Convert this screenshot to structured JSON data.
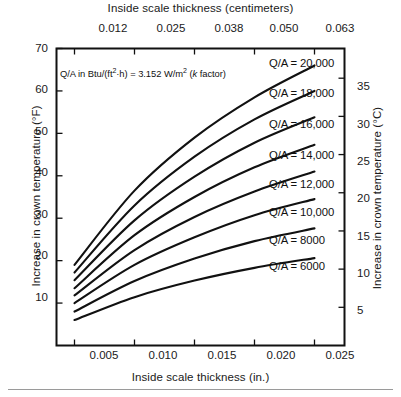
{
  "figure": {
    "background_color": "#ffffff",
    "line_color": "#111111",
    "frame_color": "#111111"
  },
  "axes": {
    "top": {
      "title": "Inside scale thickness (centimeters)",
      "ticks": [
        "0.012",
        "0.025",
        "0.038",
        "0.050",
        "0.063"
      ]
    },
    "bottom": {
      "title": "Inside scale thickness (in.)",
      "ticks": [
        "0.005",
        "0.010",
        "0.015",
        "0.020",
        "0.025"
      ]
    },
    "left": {
      "title": "Increase in crown temperature (°F)",
      "ticks": [
        "10",
        "20",
        "30",
        "40",
        "50",
        "60",
        "70"
      ]
    },
    "right": {
      "title": "Increase in crown temperature (°C)",
      "ticks": [
        "5",
        "10",
        "15",
        "20",
        "25",
        "30",
        "35"
      ]
    }
  },
  "annotation": {
    "prefix": "Q/A in Btu/(ft",
    "sup1": "2",
    "mid": "·h) = 3.152 W/m",
    "sup2": "2",
    "paren_open": " (",
    "italic_k": "k",
    "paren_close": " factor)"
  },
  "curve_labels": [
    "Q/A = 20,000",
    "Q/A = 18,000",
    "Q/A = 16,000",
    "Q/A = 14,000",
    "Q/A = 12,000",
    "Q/A = 10,000",
    "Q/A = 8000",
    "Q/A = 6000"
  ],
  "chart_data": {
    "type": "line",
    "title": "",
    "xlabel": "Inside scale thickness (in.)",
    "ylabel": "Increase in crown temperature (°F)",
    "xlabel_secondary": "Inside scale thickness (centimeters)",
    "ylabel_secondary": "Increase in crown temperature (°C)",
    "xlim": [
      0.0035,
      0.0275
    ],
    "ylim": [
      0,
      70
    ],
    "ylim_secondary": [
      0,
      38.9
    ],
    "xticks": [
      0.005,
      0.01,
      0.015,
      0.02,
      0.025
    ],
    "xticks_secondary": [
      0.012,
      0.025,
      0.038,
      0.05,
      0.063
    ],
    "yticks": [
      10,
      20,
      30,
      40,
      50,
      60,
      70
    ],
    "yticks_secondary": [
      5,
      10,
      15,
      20,
      25,
      30,
      35
    ],
    "grid": false,
    "legend": "inline-right-of-each-curve",
    "x": [
      0.005,
      0.01,
      0.015,
      0.02,
      0.025
    ],
    "series": [
      {
        "name": "Q/A = 20,000",
        "values": [
          19.0,
          36.5,
          49.0,
          58.5,
          66.0
        ]
      },
      {
        "name": "Q/A = 18,000",
        "values": [
          17.2,
          33.0,
          44.5,
          53.3,
          60.0
        ]
      },
      {
        "name": "Q/A = 16,000",
        "values": [
          15.4,
          29.5,
          39.8,
          47.8,
          53.8
        ]
      },
      {
        "name": "Q/A = 14,000",
        "values": [
          13.5,
          26.0,
          35.0,
          42.0,
          47.3
        ]
      },
      {
        "name": "Q/A = 12,000",
        "values": [
          11.8,
          22.5,
          30.3,
          36.3,
          41.0
        ]
      },
      {
        "name": "Q/A = 10,000",
        "values": [
          10.0,
          19.0,
          25.5,
          30.7,
          34.5
        ]
      },
      {
        "name": "Q/A = 8000",
        "values": [
          8.0,
          15.2,
          20.5,
          24.6,
          27.6
        ]
      },
      {
        "name": "Q/A = 6000",
        "values": [
          6.0,
          11.4,
          15.3,
          18.3,
          20.6
        ]
      }
    ],
    "series_units": "Q/A in Btu/(ft2·h)"
  }
}
